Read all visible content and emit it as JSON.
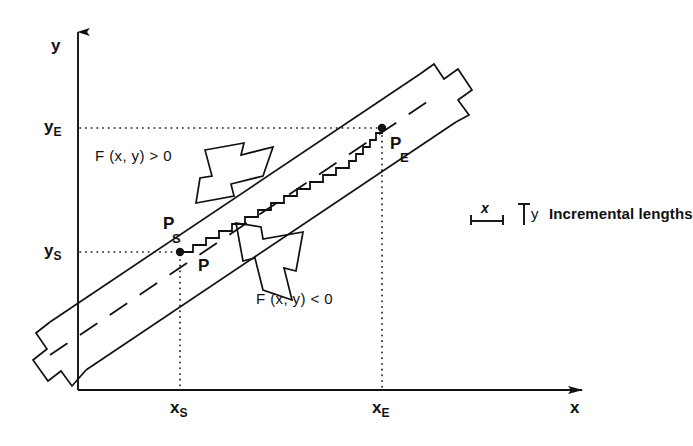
{
  "figure": {
    "type": "line-rasterization-diagram",
    "axes": {
      "y_axis_label": "y",
      "x_axis_label": "x",
      "y_tick_upper": {
        "base": "y",
        "sub": "E"
      },
      "y_tick_lower": {
        "base": "y",
        "sub": "S"
      },
      "x_tick_left": {
        "base": "x",
        "sub": "S"
      },
      "x_tick_right": {
        "base": "x",
        "sub": "E"
      }
    },
    "points": [
      {
        "name": "start-point",
        "base": "P",
        "sub": "S",
        "x": 180,
        "y": 252
      },
      {
        "name": "end-point",
        "base": "P",
        "sub": "E",
        "x": 382,
        "y": 128
      },
      {
        "name": "current-point",
        "base": "P",
        "sub": "",
        "x": 205,
        "y": 262
      }
    ],
    "region_labels": [
      {
        "name": "positive-region",
        "text": "F (x, y) > 0"
      },
      {
        "name": "negative-region",
        "text": "F (x, y) < 0"
      }
    ],
    "legend": {
      "x_symbol": "x",
      "y_symbol": "y",
      "caption": "Incremental lengths"
    },
    "colors": {
      "ink": "#111111",
      "background": "#ffffff"
    }
  }
}
